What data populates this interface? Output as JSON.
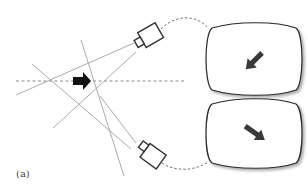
{
  "figure": {
    "label": "(a)",
    "colors": {
      "sight_line": "#9a9a9a",
      "axis_dashed": "#8a8a8a",
      "camera_stroke": "#333333",
      "screen_stroke": "#2a2a2a",
      "arrow_fill": "#111111",
      "screen_arrow_fill": "#3a3a3a"
    }
  },
  "elements": {
    "object_arrow": {
      "direction": "right"
    },
    "camera_top": {
      "orientation": "facing-lower-left"
    },
    "camera_bottom": {
      "orientation": "facing-upper-left"
    },
    "screen_top": {
      "arrow_direction": "down-left"
    },
    "screen_bottom": {
      "arrow_direction": "down-right"
    }
  }
}
